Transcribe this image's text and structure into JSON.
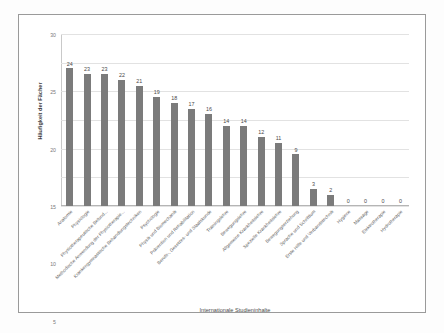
{
  "figure": {
    "background_color": "#ffffff",
    "frame_color": "#9a9a9a",
    "bar_color": "#7b7b7b",
    "grid_color": "#e2e2e2"
  },
  "chart_data": {
    "type": "bar",
    "title": "",
    "xlabel": "Internationale Studieninhalte",
    "ylabel": "Häufigkeit der Fächer",
    "ylim": [
      0,
      30
    ],
    "yticks": [
      0,
      5,
      10,
      15,
      20,
      25,
      30
    ],
    "grid": true,
    "legend": "none",
    "orientation": "vertical",
    "categories": [
      "Anatomie",
      "Physiologie",
      "Physiotherapeutische Befund...",
      "Methodische Anwendung der Physiotherapie...",
      "Krankengymnastische Behandlungstechniken",
      "Psychologie",
      "Physik und Biomechanik",
      "Prävention und Rehabilitation",
      "Berufs-, Gesetzes- und Staatskunde",
      "Trainingslehre",
      "Bewegungslehre",
      "Allgemeine Krankheitslehre",
      "Spezielle Krankheitslehre",
      "Bewegungserziehung",
      "Sprache und Schrifttum",
      "Erste Hilfe und Verbandstechnik",
      "Hygiene",
      "Massage",
      "Elektrotherapie",
      "Hydrotherapie"
    ],
    "values": [
      24,
      23,
      23,
      22,
      21,
      19,
      18,
      17,
      16,
      14,
      14,
      12,
      11,
      9,
      3,
      2,
      0,
      0,
      0,
      0
    ],
    "data_labels": [
      "24",
      "23",
      "23",
      "22",
      "21",
      "19",
      "18",
      "17",
      "16",
      "14",
      "14",
      "12",
      "11",
      "9",
      "3",
      "2",
      "0",
      "0",
      "0",
      "0"
    ]
  }
}
